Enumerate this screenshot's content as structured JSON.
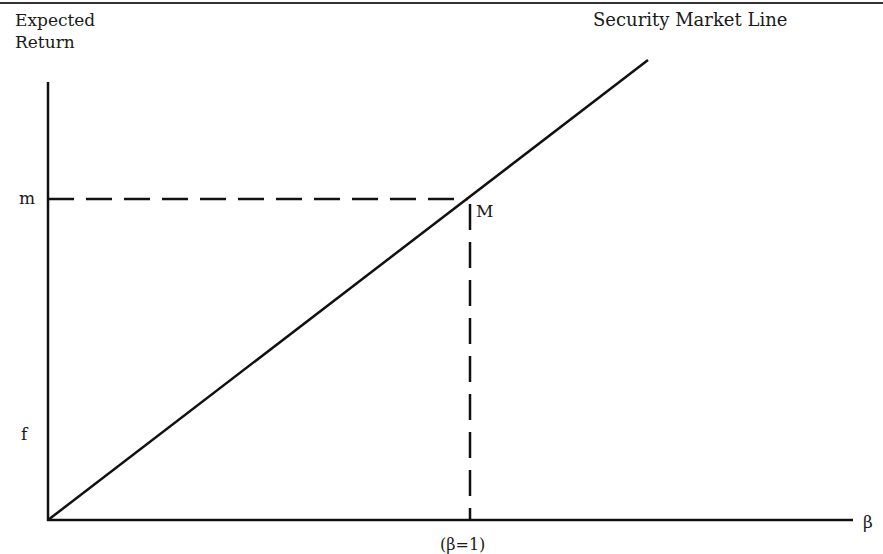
{
  "diagram": {
    "title": "Security Market Line",
    "y_axis_label_line1": "Expected",
    "y_axis_label_line2": "Return",
    "x_axis_label": "β",
    "y_tick_m": "m",
    "y_tick_f": "f",
    "point_label": "M",
    "x_tick_beta1": "(β=1)",
    "line_color": "#111111",
    "background": "#ffffff"
  }
}
